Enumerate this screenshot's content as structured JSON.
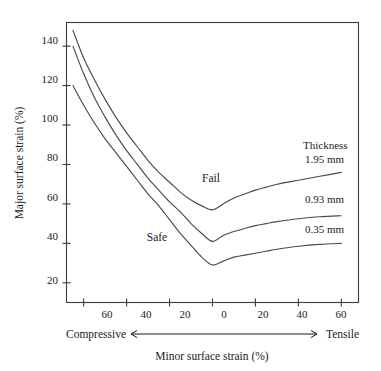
{
  "chart_data": {
    "type": "line",
    "title": "",
    "xlabel": "Minor surface strain (%)",
    "ylabel": "Major surface strain (%)",
    "xlim": [
      -68,
      68
    ],
    "ylim": [
      10,
      152
    ],
    "grid": false,
    "legend_position": "inside-right",
    "x_ticks": [
      -60,
      -40,
      -20,
      0,
      20,
      40,
      60
    ],
    "x_tick_labels": [
      "60",
      "40",
      "20",
      "0",
      "20",
      "40",
      "60"
    ],
    "y_ticks": [
      20,
      40,
      60,
      80,
      100,
      120,
      140
    ],
    "y_tick_labels": [
      "20",
      "40",
      "60",
      "80",
      "100",
      "120",
      "140"
    ],
    "direction_left_label": "Compressive",
    "direction_right_label": "Tensile",
    "annotations": [
      {
        "text": "Fail",
        "x": -8,
        "y": 80
      },
      {
        "text": "Safe",
        "x": -36,
        "y": 40
      },
      {
        "text": "Thickness",
        "x": 34,
        "y": 92
      }
    ],
    "series": [
      {
        "name": "1.95 mm",
        "label": "1.95 mm",
        "points": [
          [
            -65,
            148
          ],
          [
            -60,
            134
          ],
          [
            -55,
            123
          ],
          [
            -50,
            113
          ],
          [
            -45,
            104
          ],
          [
            -40,
            96
          ],
          [
            -35,
            89
          ],
          [
            -30,
            82
          ],
          [
            -25,
            76
          ],
          [
            -20,
            71
          ],
          [
            -15,
            66
          ],
          [
            -10,
            62
          ],
          [
            -5,
            59
          ],
          [
            0,
            57
          ],
          [
            5,
            60
          ],
          [
            10,
            63
          ],
          [
            15,
            65
          ],
          [
            20,
            67
          ],
          [
            25,
            68.5
          ],
          [
            30,
            70
          ],
          [
            40,
            72
          ],
          [
            50,
            74
          ],
          [
            60,
            76
          ]
        ]
      },
      {
        "name": "0.93 mm",
        "label": "0.93 mm",
        "points": [
          [
            -65,
            140
          ],
          [
            -60,
            126
          ],
          [
            -55,
            114
          ],
          [
            -50,
            104
          ],
          [
            -45,
            95
          ],
          [
            -40,
            87
          ],
          [
            -35,
            80
          ],
          [
            -30,
            73
          ],
          [
            -25,
            67
          ],
          [
            -20,
            61
          ],
          [
            -15,
            56
          ],
          [
            -10,
            50
          ],
          [
            -5,
            45
          ],
          [
            0,
            41
          ],
          [
            5,
            44
          ],
          [
            10,
            46
          ],
          [
            15,
            47.5
          ],
          [
            20,
            49
          ],
          [
            25,
            50
          ],
          [
            30,
            51
          ],
          [
            40,
            52.5
          ],
          [
            50,
            53.5
          ],
          [
            60,
            54
          ]
        ]
      },
      {
        "name": "0.35 mm",
        "label": "0.35 mm",
        "points": [
          [
            -65,
            120
          ],
          [
            -60,
            110
          ],
          [
            -55,
            101
          ],
          [
            -50,
            93
          ],
          [
            -45,
            86
          ],
          [
            -40,
            79
          ],
          [
            -35,
            72
          ],
          [
            -30,
            65
          ],
          [
            -25,
            59
          ],
          [
            -20,
            52
          ],
          [
            -15,
            45
          ],
          [
            -10,
            39
          ],
          [
            -5,
            33
          ],
          [
            0,
            29
          ],
          [
            5,
            31
          ],
          [
            10,
            33
          ],
          [
            15,
            34
          ],
          [
            20,
            35
          ],
          [
            25,
            36
          ],
          [
            30,
            37
          ],
          [
            40,
            38.5
          ],
          [
            50,
            39.5
          ],
          [
            60,
            40
          ]
        ]
      }
    ]
  },
  "axes": {
    "y_title": "Major surface strain (%)",
    "x_title": "Minor surface strain (%)",
    "left_direction": "Compressive",
    "right_direction": "Tensile"
  },
  "labels": {
    "fail": "Fail",
    "safe": "Safe",
    "thickness_header": "Thickness",
    "series_1": "1.95 mm",
    "series_2": "0.93 mm",
    "series_3": "0.35 mm"
  },
  "y_ticks": {
    "t0": "20",
    "t1": "40",
    "t2": "60",
    "t3": "80",
    "t4": "100",
    "t5": "120",
    "t6": "140"
  },
  "x_ticks": {
    "t0": "60",
    "t1": "40",
    "t2": "20",
    "t3": "0",
    "t4": "20",
    "t5": "40",
    "t6": "60"
  },
  "colors": {
    "curve": "#4a4a4a",
    "frame": "#3b3b3b",
    "text": "#1a1a1a",
    "background": "#ffffff"
  }
}
